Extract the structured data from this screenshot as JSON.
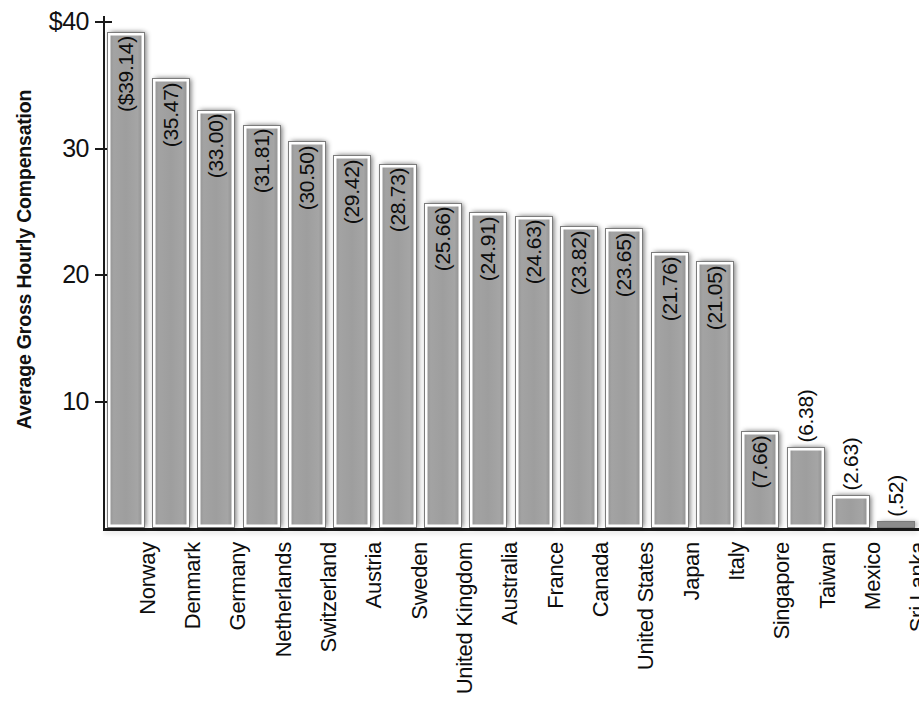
{
  "chart_data": {
    "type": "bar",
    "title": "",
    "subtitle": "",
    "xlabel": "",
    "ylabel": "Average Gross Hourly Compensation",
    "ylim": [
      0,
      41.5
    ],
    "yticks": [
      10,
      20,
      30,
      40
    ],
    "ytick_labels": [
      "10",
      "20",
      "30",
      "40"
    ],
    "ytick_label_top": "$40",
    "grid": false,
    "legend": null,
    "orientation": "vertical",
    "currency_symbol": "$",
    "categories": [
      "Norway",
      "Denmark",
      "Germany",
      "Netherlands",
      "Switzerland",
      "Austria",
      "Sweden",
      "United Kingdom",
      "Australia",
      "France",
      "Canada",
      "United States",
      "Japan",
      "Italy",
      "Singapore",
      "Taiwan",
      "Mexico",
      "Sri Lanka"
    ],
    "values": [
      39.14,
      35.47,
      33.0,
      31.81,
      30.5,
      29.42,
      28.73,
      25.66,
      24.91,
      24.63,
      23.82,
      23.65,
      21.76,
      21.05,
      7.66,
      6.38,
      2.63,
      0.52
    ],
    "data_labels": [
      "($39.14)",
      "(35.47)",
      "(33.00)",
      "(31.81)",
      "(30.50)",
      "(29.42)",
      "(28.73)",
      "(25.66)",
      "(24.91)",
      "(24.63)",
      "(23.82)",
      "(23.65)",
      "(21.76)",
      "(21.05)",
      "(7.66)",
      "(6.38)",
      "(2.63)",
      "(.52)"
    ],
    "colors": {
      "bar_fill": "#9b9b9b",
      "bar_edge": "#7b7b7b",
      "axis": "#1a1a1a",
      "text": "#0d0d0d",
      "background": "#ffffff"
    }
  }
}
